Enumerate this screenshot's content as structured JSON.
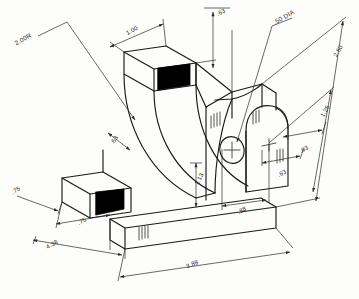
{
  "drawing": {
    "title": "Isometric bracket pictorial with dimensions",
    "type": "isometric-technical-drawing",
    "paper_color": "#fdfdfc",
    "line_color": "#1a1a1a",
    "shaded_face_color": "#000000",
    "dimension_color": "#2a2a2a"
  },
  "dimensions": [
    {
      "id": "radius-left",
      "label": "2.00R",
      "x": 24,
      "y": 41,
      "rotate": -30,
      "anchor": "middle"
    },
    {
      "id": "top-depth",
      "label": "1.00",
      "x": 133,
      "y": 32,
      "rotate": -30,
      "anchor": "middle"
    },
    {
      "id": "top-rib-thickness",
      "label": ".63",
      "x": 222,
      "y": 14,
      "rotate": -30,
      "anchor": "middle"
    },
    {
      "id": "hole-diameter",
      "label": ".50 DIA",
      "x": 285,
      "y": 19,
      "rotate": -30,
      "anchor": "middle"
    },
    {
      "id": "overall-height",
      "label": "2.50",
      "x": 340,
      "y": 52,
      "rotate": -60,
      "anchor": "middle"
    },
    {
      "id": "hole-height",
      "label": "1.25",
      "x": 327,
      "y": 112,
      "rotate": -60,
      "anchor": "middle"
    },
    {
      "id": "right-depth-upper",
      "label": ".63",
      "x": 305,
      "y": 151,
      "rotate": -30,
      "anchor": "middle"
    },
    {
      "id": "right-depth-lower",
      "label": ".63",
      "x": 283,
      "y": 175,
      "rotate": -30,
      "anchor": "middle"
    },
    {
      "id": "curve-web-thickness",
      "label": ".63",
      "x": 116,
      "y": 141,
      "rotate": -58,
      "anchor": "middle"
    },
    {
      "id": "base-height",
      "label": "1.13",
      "x": 201,
      "y": 180,
      "rotate": -62,
      "anchor": "middle"
    },
    {
      "id": "hole-offset",
      "label": ".88",
      "x": 243,
      "y": 212,
      "rotate": -30,
      "anchor": "middle"
    },
    {
      "id": "left-foot-width",
      "label": ".75",
      "x": 17,
      "y": 192,
      "rotate": -30,
      "anchor": "middle"
    },
    {
      "id": "left-foot-depth",
      "label": ".75",
      "x": 83,
      "y": 223,
      "rotate": -30,
      "anchor": "middle"
    },
    {
      "id": "overall-depth",
      "label": "4.38",
      "x": 53,
      "y": 246,
      "rotate": -30,
      "anchor": "middle"
    },
    {
      "id": "overall-length",
      "label": "3.88",
      "x": 193,
      "y": 266,
      "rotate": -22,
      "anchor": "middle"
    }
  ],
  "features": {
    "hole": {
      "name": "through-hole",
      "label": ".50 DIA",
      "center_mark": true
    },
    "shaded_faces": 2,
    "curved_cutout": "concave fillet sweep",
    "arch_top": "rounded right upright"
  }
}
